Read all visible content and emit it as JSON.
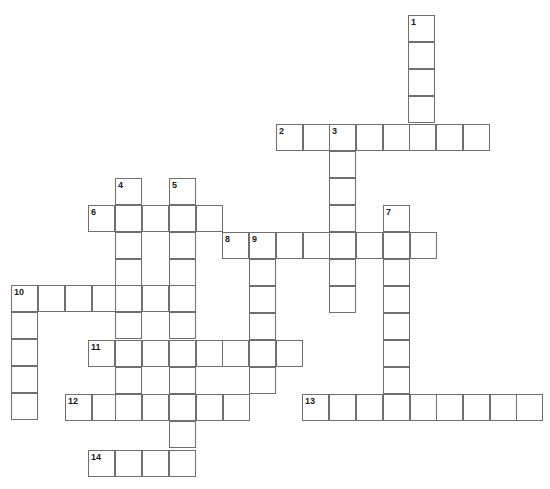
{
  "puzzle": {
    "title": "Crossword Puzzle Grid",
    "cell_size": 27,
    "grid_width": 550,
    "grid_height": 489,
    "background_color": "#ffffff",
    "cell_border_color": "#6f6f6f",
    "number_color": "#1a1a1a",
    "entry_count": 14,
    "entries": [
      {
        "number": "1",
        "direction": "down",
        "x": 408,
        "y": 15,
        "length": 4
      },
      {
        "number": "2",
        "direction": "across",
        "x": 276,
        "y": 124,
        "length": 8
      },
      {
        "number": "3",
        "direction": "down",
        "x": 329,
        "y": 124,
        "length": 7
      },
      {
        "number": "4",
        "direction": "down",
        "x": 115,
        "y": 178,
        "length": 7
      },
      {
        "number": "5",
        "direction": "down",
        "x": 169,
        "y": 178,
        "length": 11
      },
      {
        "number": "6",
        "direction": "across",
        "x": 88,
        "y": 205,
        "length": 5
      },
      {
        "number": "7",
        "direction": "down",
        "x": 383,
        "y": 205,
        "length": 8
      },
      {
        "number": "8",
        "direction": "across",
        "x": 222,
        "y": 232,
        "length": 7
      },
      {
        "number": "9",
        "direction": "down",
        "x": 249,
        "y": 232,
        "length": 6
      },
      {
        "number": "10",
        "direction": "across",
        "x": 11,
        "y": 285,
        "length": 7
      },
      {
        "number": "10",
        "direction": "down",
        "x": 11,
        "y": 285,
        "length": 5
      },
      {
        "number": "11",
        "direction": "across",
        "x": 88,
        "y": 340,
        "length": 8
      },
      {
        "number": "12",
        "direction": "across",
        "x": 65,
        "y": 394,
        "length": 7
      },
      {
        "number": "13",
        "direction": "across",
        "x": 302,
        "y": 394,
        "length": 9
      },
      {
        "number": "14",
        "direction": "across",
        "x": 88,
        "y": 450,
        "length": 4
      }
    ],
    "numbered_cells": [
      {
        "label": "1",
        "x": 408,
        "y": 15
      },
      {
        "label": "2",
        "x": 276,
        "y": 124
      },
      {
        "label": "3",
        "x": 329,
        "y": 124
      },
      {
        "label": "4",
        "x": 115,
        "y": 178
      },
      {
        "label": "5",
        "x": 169,
        "y": 178
      },
      {
        "label": "6",
        "x": 88,
        "y": 205
      },
      {
        "label": "7",
        "x": 383,
        "y": 205
      },
      {
        "label": "8",
        "x": 222,
        "y": 232
      },
      {
        "label": "9",
        "x": 249,
        "y": 232
      },
      {
        "label": "10",
        "x": 11,
        "y": 285
      },
      {
        "label": "11",
        "x": 88,
        "y": 340
      },
      {
        "label": "12",
        "x": 65,
        "y": 394
      },
      {
        "label": "13",
        "x": 302,
        "y": 394
      },
      {
        "label": "14",
        "x": 88,
        "y": 450
      }
    ],
    "cells": [
      {
        "x": 408,
        "y": 15
      },
      {
        "x": 408,
        "y": 42
      },
      {
        "x": 408,
        "y": 69
      },
      {
        "x": 408,
        "y": 96
      },
      {
        "x": 276,
        "y": 124
      },
      {
        "x": 303,
        "y": 124
      },
      {
        "x": 329,
        "y": 124
      },
      {
        "x": 356,
        "y": 124
      },
      {
        "x": 383,
        "y": 124
      },
      {
        "x": 409,
        "y": 124
      },
      {
        "x": 436,
        "y": 124
      },
      {
        "x": 463,
        "y": 124
      },
      {
        "x": 329,
        "y": 151
      },
      {
        "x": 329,
        "y": 178
      },
      {
        "x": 329,
        "y": 205
      },
      {
        "x": 329,
        "y": 232
      },
      {
        "x": 329,
        "y": 259
      },
      {
        "x": 329,
        "y": 286
      },
      {
        "x": 115,
        "y": 178
      },
      {
        "x": 169,
        "y": 178
      },
      {
        "x": 88,
        "y": 205
      },
      {
        "x": 115,
        "y": 205
      },
      {
        "x": 142,
        "y": 205
      },
      {
        "x": 169,
        "y": 205
      },
      {
        "x": 196,
        "y": 205
      },
      {
        "x": 383,
        "y": 205
      },
      {
        "x": 383,
        "y": 232
      },
      {
        "x": 383,
        "y": 259
      },
      {
        "x": 383,
        "y": 286
      },
      {
        "x": 383,
        "y": 313
      },
      {
        "x": 383,
        "y": 340
      },
      {
        "x": 383,
        "y": 367
      },
      {
        "x": 383,
        "y": 394
      },
      {
        "x": 115,
        "y": 232
      },
      {
        "x": 169,
        "y": 232
      },
      {
        "x": 222,
        "y": 232
      },
      {
        "x": 249,
        "y": 232
      },
      {
        "x": 276,
        "y": 232
      },
      {
        "x": 303,
        "y": 232
      },
      {
        "x": 356,
        "y": 232
      },
      {
        "x": 410,
        "y": 232
      },
      {
        "x": 249,
        "y": 259
      },
      {
        "x": 249,
        "y": 286
      },
      {
        "x": 249,
        "y": 313
      },
      {
        "x": 249,
        "y": 340
      },
      {
        "x": 249,
        "y": 367
      },
      {
        "x": 115,
        "y": 259
      },
      {
        "x": 169,
        "y": 259
      },
      {
        "x": 11,
        "y": 285
      },
      {
        "x": 38,
        "y": 285
      },
      {
        "x": 65,
        "y": 285
      },
      {
        "x": 92,
        "y": 285
      },
      {
        "x": 115,
        "y": 285
      },
      {
        "x": 142,
        "y": 285
      },
      {
        "x": 169,
        "y": 285
      },
      {
        "x": 11,
        "y": 312
      },
      {
        "x": 11,
        "y": 339
      },
      {
        "x": 11,
        "y": 366
      },
      {
        "x": 11,
        "y": 393
      },
      {
        "x": 115,
        "y": 312
      },
      {
        "x": 169,
        "y": 312
      },
      {
        "x": 88,
        "y": 340
      },
      {
        "x": 115,
        "y": 340
      },
      {
        "x": 142,
        "y": 340
      },
      {
        "x": 169,
        "y": 340
      },
      {
        "x": 196,
        "y": 340
      },
      {
        "x": 222,
        "y": 340
      },
      {
        "x": 276,
        "y": 340
      },
      {
        "x": 115,
        "y": 367
      },
      {
        "x": 169,
        "y": 367
      },
      {
        "x": 65,
        "y": 394
      },
      {
        "x": 92,
        "y": 394
      },
      {
        "x": 115,
        "y": 394
      },
      {
        "x": 142,
        "y": 394
      },
      {
        "x": 169,
        "y": 394
      },
      {
        "x": 196,
        "y": 394
      },
      {
        "x": 223,
        "y": 394
      },
      {
        "x": 302,
        "y": 394
      },
      {
        "x": 329,
        "y": 394
      },
      {
        "x": 356,
        "y": 394
      },
      {
        "x": 410,
        "y": 394
      },
      {
        "x": 436,
        "y": 394
      },
      {
        "x": 463,
        "y": 394
      },
      {
        "x": 490,
        "y": 394
      },
      {
        "x": 516,
        "y": 394
      },
      {
        "x": 169,
        "y": 421
      },
      {
        "x": 88,
        "y": 450
      },
      {
        "x": 115,
        "y": 450
      },
      {
        "x": 142,
        "y": 450
      },
      {
        "x": 169,
        "y": 450
      }
    ]
  }
}
